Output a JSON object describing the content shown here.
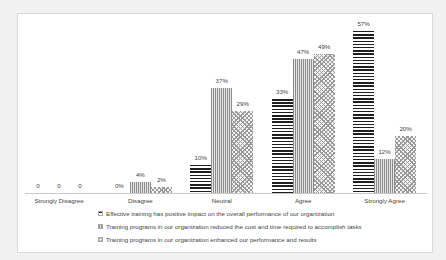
{
  "chart_data": {
    "type": "bar",
    "title": "",
    "categories": [
      "Strongly Disagree",
      "Disagree",
      "Neutral",
      "Agree",
      "Strongly Agree"
    ],
    "series": [
      {
        "name": "Effective training has positive impact on the overall performance of our organization",
        "pattern": "horizontal-lines",
        "values": [
          0,
          0,
          10,
          33,
          57
        ],
        "data_labels": [
          "0",
          "0%",
          "10%",
          "33%",
          "57%"
        ]
      },
      {
        "name": "Training programs in our organization reduced the cost and time required to accomplish tasks",
        "pattern": "vertical-lines",
        "values": [
          0,
          4,
          37,
          47,
          12
        ],
        "data_labels": [
          "0",
          "4%",
          "37%",
          "47%",
          "12%"
        ]
      },
      {
        "name": "Training programs in our organization enhanced our  performance and results",
        "pattern": "diagonal-crosshatch",
        "values": [
          0,
          2,
          29,
          49,
          20
        ],
        "data_labels": [
          "0",
          "2%",
          "29%",
          "49%",
          "20%"
        ]
      }
    ],
    "ylim": [
      0,
      60
    ],
    "y_axis_visible": false,
    "x_axis_visible": true,
    "grid": false,
    "data_labels_visible": true,
    "legend_position": "bottom",
    "colors": {
      "series1_lines": "#1f1f1f",
      "series2_lines": "#8c8c8c",
      "series3_lines": "#999999",
      "axis_line": "#c9c9c9",
      "text": "#3f3f3f",
      "chart_border": "#d9d9d9",
      "plot_background": "#ffffff",
      "outer_background": "#f1f1f1"
    }
  }
}
